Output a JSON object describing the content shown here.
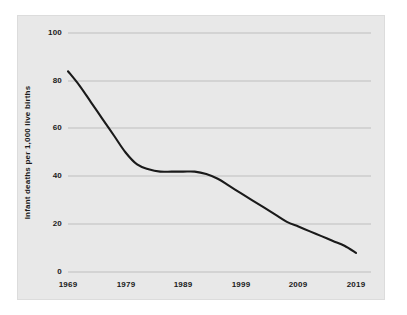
{
  "chart_data": {
    "type": "line",
    "title": "",
    "subtitle": "",
    "xlabel": "",
    "ylabel": "Infant deaths per 1,000 live births",
    "xlim": [
      1969,
      2019
    ],
    "ylim": [
      0,
      100
    ],
    "xticks": [
      "1969",
      "1979",
      "1989",
      "1999",
      "2009",
      "2019"
    ],
    "yticks": [
      "0",
      "20",
      "40",
      "60",
      "80",
      "100"
    ],
    "grid": "horizontal",
    "legend": "none",
    "annotations": [],
    "series": [
      {
        "name": "Infant mortality rate",
        "color": "#1a1a1a",
        "x": [
          1969,
          1971,
          1973,
          1975,
          1977,
          1979,
          1981,
          1983,
          1985,
          1987,
          1989,
          1991,
          1993,
          1995,
          1997,
          1999,
          2001,
          2003,
          2005,
          2007,
          2009,
          2011,
          2013,
          2015,
          2017,
          2019
        ],
        "values": [
          84,
          78,
          71,
          64,
          57,
          50,
          45,
          43,
          42,
          42,
          42,
          42,
          41,
          39,
          36,
          33,
          30,
          27,
          24,
          21,
          19,
          17,
          15,
          13,
          11,
          8
        ]
      }
    ]
  },
  "axes": {
    "y_tick_labels": [
      "100",
      "80",
      "60",
      "40",
      "20",
      "0"
    ],
    "x_tick_labels": [
      "1969",
      "1979",
      "1989",
      "1999",
      "2009",
      "2019"
    ],
    "y_axis_title": "Infant deaths per 1,000 live births"
  },
  "style": {
    "panel_background": "#e8e8e8",
    "figure_background": "#ffffff",
    "grid_color": "#b4b4b4",
    "line_color": "#1a1a1a",
    "text_color": "#1a1a1a"
  }
}
